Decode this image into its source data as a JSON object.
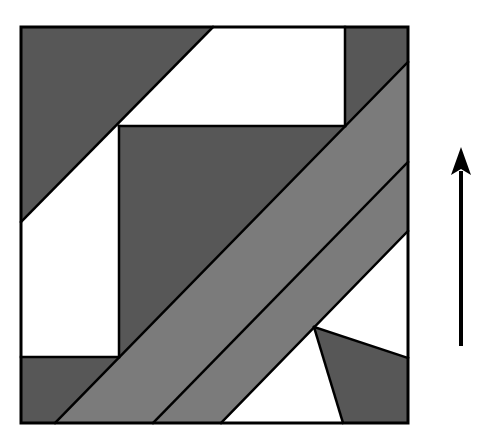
{
  "diagram": {
    "title": "",
    "colors": {
      "dark": "#575757",
      "mid": "#7b7b7b",
      "white": "#ffffff",
      "stroke": "#000000",
      "background": "#ffffff"
    },
    "frame": {
      "x": 21,
      "y": 27,
      "width": 387,
      "height": 396
    },
    "regions": [
      {
        "name": "top-left-triangle",
        "fill": "dark",
        "points": "21,27 213,27 21,222"
      },
      {
        "name": "top-white-band",
        "fill": "white",
        "points": "213,27 345,27 345,126 119,126 21,222 21,222"
      },
      {
        "name": "top-right-dark-strip",
        "fill": "dark",
        "points": "345,27 408,27 408,62 345,126"
      },
      {
        "name": "left-white-rect",
        "fill": "white",
        "points": "21,222 119,126 119,357 21,357"
      },
      {
        "name": "inner-dark-square",
        "fill": "dark",
        "points": "119,126 345,126 119,357"
      },
      {
        "name": "bottom-left-dark-strip",
        "fill": "dark",
        "points": "21,357 119,357 55,423 21,423"
      },
      {
        "name": "diagonal-band-1",
        "fill": "mid",
        "points": "345,126 408,62 408,162 153,423 55,423 119,357"
      },
      {
        "name": "diagonal-band-2",
        "fill": "mid",
        "points": "408,162 408,231 221,423 153,423"
      },
      {
        "name": "right-white-triangle",
        "fill": "white",
        "points": "408,231 408,358 314,327"
      },
      {
        "name": "bottom-white-triangle",
        "fill": "white",
        "points": "314,327 343,423 221,423"
      },
      {
        "name": "bottom-right-dark-quad",
        "fill": "dark",
        "points": "314,327 408,358 408,423 343,423"
      }
    ],
    "lines": [
      {
        "name": "diagonal-line-1",
        "x1": 213,
        "y1": 27,
        "x2": 21,
        "y2": 222
      },
      {
        "name": "diagonal-line-2",
        "x1": 408,
        "y1": 62,
        "x2": 55,
        "y2": 423
      },
      {
        "name": "diagonal-line-3",
        "x1": 408,
        "y1": 162,
        "x2": 153,
        "y2": 423
      },
      {
        "name": "diagonal-line-4",
        "x1": 408,
        "y1": 231,
        "x2": 221,
        "y2": 423
      },
      {
        "name": "vertical-line-top-right",
        "x1": 345,
        "y1": 27,
        "x2": 345,
        "y2": 126
      },
      {
        "name": "horizontal-line-inner-top",
        "x1": 119,
        "y1": 126,
        "x2": 345,
        "y2": 126
      },
      {
        "name": "vertical-line-inner-left",
        "x1": 119,
        "y1": 126,
        "x2": 119,
        "y2": 357
      },
      {
        "name": "horizontal-line-inner-bottom",
        "x1": 21,
        "y1": 357,
        "x2": 119,
        "y2": 357
      },
      {
        "name": "quad-edge-right",
        "x1": 314,
        "y1": 327,
        "x2": 408,
        "y2": 358
      },
      {
        "name": "quad-edge-bottom",
        "x1": 314,
        "y1": 327,
        "x2": 343,
        "y2": 423
      }
    ],
    "arrow": {
      "name": "up-arrow",
      "x": 461,
      "y_tail": 346,
      "y_tip": 147,
      "head_height": 28,
      "head_half_width": 10,
      "shaft_width": 4
    }
  }
}
